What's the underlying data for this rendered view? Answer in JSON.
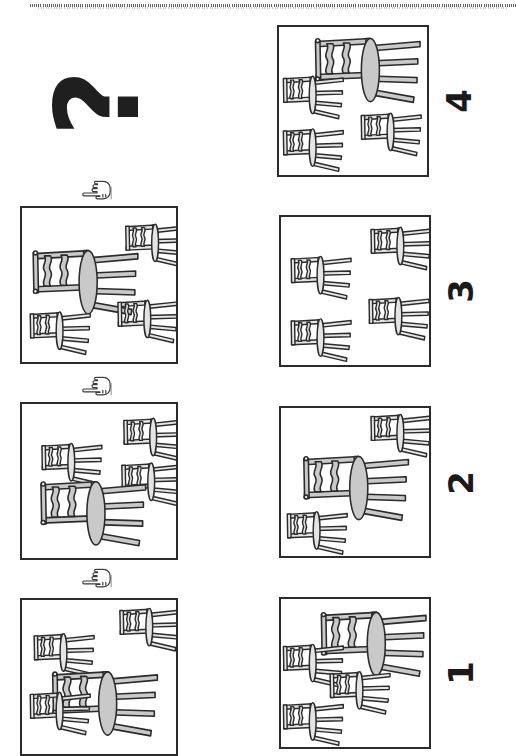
{
  "page": {
    "orientation": "rotated-90-ccw",
    "background_color": "#ffffff",
    "ink_color": "#2b2b2b",
    "chair_fill_color": "#c9c9c9",
    "top_rule": "dotted-separator"
  },
  "prompt": {
    "question_mark": "?",
    "pointer_icon": "pointing-hand-icon",
    "pointer_count": 3
  },
  "sequence": {
    "title": "chair arrangement sequence",
    "panels": [
      {
        "id": "seq-1",
        "position": "left-column-bottom",
        "big_chair": {
          "label": "upright chair",
          "x": 96,
          "y": 96,
          "scale": 1.0,
          "rotation": 0
        },
        "small_chairs": [
          {
            "label": "small chair",
            "x": 44,
            "y": 42,
            "scale": 0.44
          },
          {
            "label": "small chair",
            "x": 122,
            "y": 28,
            "scale": 0.44
          },
          {
            "label": "small chair",
            "x": 40,
            "y": 126,
            "scale": 0.44
          }
        ]
      },
      {
        "id": "seq-2",
        "position": "left-column-middle",
        "big_chair": {
          "label": "upright chair",
          "x": 78,
          "y": 62,
          "scale": 1.0,
          "rotation": 0
        },
        "small_chairs": [
          {
            "label": "small chair",
            "x": 120,
            "y": 30,
            "scale": 0.44
          },
          {
            "label": "small chair",
            "x": 40,
            "y": 118,
            "scale": 0.44
          },
          {
            "label": "small chair",
            "x": 122,
            "y": 122,
            "scale": 0.44
          }
        ]
      },
      {
        "id": "seq-3",
        "position": "left-column-top",
        "big_chair": {
          "label": "upright chair",
          "x": 66,
          "y": 62,
          "scale": 1.0,
          "rotation": 0
        },
        "small_chairs": [
          {
            "label": "small chair",
            "x": 124,
            "y": 28,
            "scale": 0.44
          },
          {
            "label": "small chair",
            "x": 120,
            "y": 118,
            "scale": 0.44
          },
          {
            "label": "small chair",
            "x": 40,
            "y": 132,
            "scale": 0.44
          }
        ]
      }
    ]
  },
  "answers": {
    "title": "answer options",
    "options": [
      {
        "number": "1",
        "id": "answer-1",
        "big_chair": {
          "label": "upright chair",
          "x": 86,
          "y": 42,
          "scale": 1.0
        },
        "small_chairs": [
          {
            "label": "small chair",
            "x": 30,
            "y": 70,
            "scale": 0.44
          },
          {
            "label": "small chair",
            "x": 74,
            "y": 96,
            "scale": 0.44
          },
          {
            "label": "small chair",
            "x": 30,
            "y": 126,
            "scale": 0.44
          }
        ]
      },
      {
        "number": "2",
        "id": "answer-2",
        "big_chair": {
          "label": "upright chair",
          "x": 76,
          "y": 84,
          "scale": 1.0
        },
        "small_chairs": [
          {
            "label": "small chair",
            "x": 124,
            "y": 28,
            "scale": 0.44
          },
          {
            "label": "small chair",
            "x": 34,
            "y": 132,
            "scale": 0.44
          }
        ]
      },
      {
        "number": "3",
        "id": "answer-3",
        "big_chair": null,
        "small_chairs": [
          {
            "label": "small chair",
            "x": 122,
            "y": 34,
            "scale": 0.44
          },
          {
            "label": "small chair",
            "x": 40,
            "y": 68,
            "scale": 0.44
          },
          {
            "label": "small chair",
            "x": 122,
            "y": 118,
            "scale": 0.44
          },
          {
            "label": "small chair",
            "x": 40,
            "y": 136,
            "scale": 0.44
          }
        ]
      },
      {
        "number": "4",
        "id": "answer-4",
        "big_chair": {
          "label": "upright chair",
          "x": 92,
          "y": 44,
          "scale": 1.0
        },
        "small_chairs": [
          {
            "label": "small chair",
            "x": 30,
            "y": 76,
            "scale": 0.44
          },
          {
            "label": "small chair",
            "x": 118,
            "y": 118,
            "scale": 0.44
          },
          {
            "label": "small chair",
            "x": 30,
            "y": 132,
            "scale": 0.44
          }
        ]
      }
    ]
  }
}
